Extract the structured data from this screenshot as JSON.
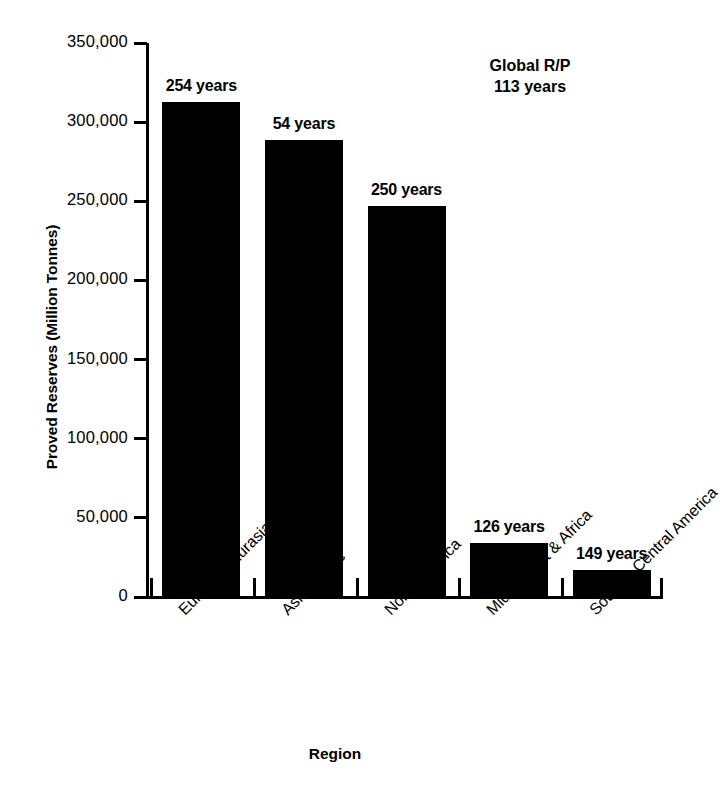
{
  "chart_data": {
    "type": "bar",
    "title": "",
    "xlabel": "Region",
    "ylabel": "Proved Reserves (Million Tonnes)",
    "categories": [
      "Europe & Eurasia",
      "Asia-Pacific",
      "North America",
      "Middle East & Africa",
      "South & Central America"
    ],
    "values": [
      313000,
      289000,
      247000,
      34000,
      17000
    ],
    "bar_labels": [
      "254 years",
      "54 years",
      "250 years",
      "126 years",
      "149 years"
    ],
    "reserve_to_production_years": [
      254,
      54,
      250,
      126,
      149
    ],
    "ylim": [
      0,
      350000
    ],
    "yticks": [
      0,
      50000,
      100000,
      150000,
      200000,
      250000,
      300000,
      350000
    ],
    "ytick_labels": [
      "0",
      "50,000",
      "100,000",
      "150,000",
      "200,000",
      "250,000",
      "300,000",
      "350,000"
    ],
    "grid": false,
    "legend": false,
    "bar_color": "#000000",
    "background_color": "#ffffff",
    "annotations": [
      {
        "text_line1": "Global R/P",
        "text_line2": "113 years",
        "position": "top-right"
      }
    ]
  },
  "annotation": {
    "line1": "Global R/P",
    "line2": "113 years"
  }
}
